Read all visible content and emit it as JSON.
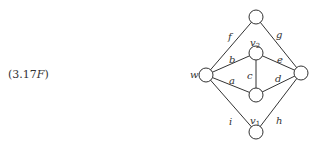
{
  "equation_label": {
    "prefix": "(3.17",
    "suffix_italic": "F",
    "close": ")"
  },
  "graph": {
    "nodes": [
      {
        "id": "top",
        "x": 256,
        "y": 17,
        "label": ""
      },
      {
        "id": "v2",
        "x": 256,
        "y": 53,
        "label": "v",
        "sub": "2",
        "lx": 250,
        "ly": 46
      },
      {
        "id": "w",
        "x": 206,
        "y": 75,
        "label": "w",
        "lx": 190,
        "ly": 78
      },
      {
        "id": "right",
        "x": 301,
        "y": 73,
        "label": ""
      },
      {
        "id": "v1",
        "x": 256,
        "y": 95,
        "label": "v",
        "sub": "1",
        "lx": 250,
        "ly": 124
      },
      {
        "id": "bottom",
        "x": 256,
        "y": 132,
        "label": ""
      }
    ],
    "edges": [
      {
        "from": "w",
        "to": "top",
        "label": "f",
        "lx": 228,
        "ly": 40
      },
      {
        "from": "top",
        "to": "right",
        "label": "g",
        "lx": 276,
        "ly": 38
      },
      {
        "from": "w",
        "to": "v2",
        "label": "b",
        "lx": 229,
        "ly": 63
      },
      {
        "from": "v2",
        "to": "right",
        "label": "e",
        "lx": 277,
        "ly": 63
      },
      {
        "from": "v2",
        "to": "v1",
        "label": "c",
        "lx": 247,
        "ly": 79
      },
      {
        "from": "w",
        "to": "v1",
        "label": "a",
        "lx": 229,
        "ly": 84
      },
      {
        "from": "v1",
        "to": "right",
        "label": "d",
        "lx": 275,
        "ly": 82
      },
      {
        "from": "w",
        "to": "bottom",
        "label": "i",
        "lx": 229,
        "ly": 125
      },
      {
        "from": "right",
        "to": "bottom",
        "label": "h",
        "lx": 276,
        "ly": 124
      }
    ],
    "node_radius": 7
  }
}
